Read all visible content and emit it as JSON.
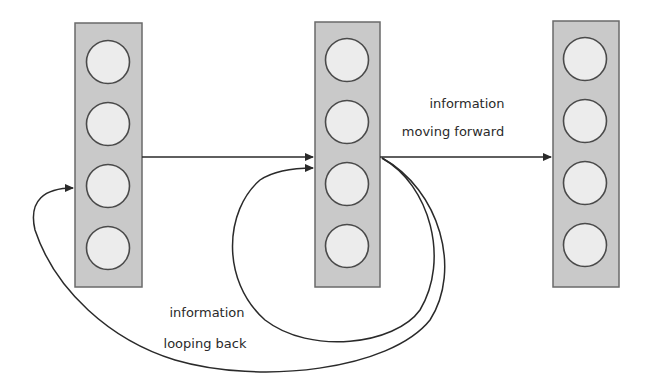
{
  "diagram": {
    "type": "recurrent-neural-network",
    "layers": [
      {
        "id": "layer-1",
        "neurons": 4
      },
      {
        "id": "layer-2",
        "neurons": 4
      },
      {
        "id": "layer-3",
        "neurons": 4
      }
    ],
    "labels": {
      "forward_line1": "information",
      "forward_line2": "moving forward",
      "loop_line1": "information",
      "loop_line2": "looping back"
    },
    "edges": [
      {
        "from": "layer-1",
        "to": "layer-2",
        "kind": "forward"
      },
      {
        "from": "layer-2",
        "to": "layer-3",
        "kind": "forward",
        "label": "information moving forward"
      },
      {
        "from": "layer-2",
        "to": "layer-2",
        "kind": "loop-back"
      },
      {
        "from": "layer-2",
        "to": "layer-1",
        "kind": "loop-back",
        "label": "information looping back"
      }
    ],
    "colors": {
      "layer_fill": "#c9c9c9",
      "neuron_fill": "#ececec",
      "stroke": "#2a2a2a"
    }
  }
}
